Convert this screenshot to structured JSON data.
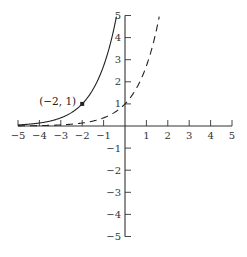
{
  "chart_data": {
    "type": "line",
    "title": "",
    "xlabel": "",
    "ylabel": "",
    "xlim": [
      -5,
      5
    ],
    "ylim": [
      -5,
      5
    ],
    "grid": false,
    "legend": null,
    "x_ticks": [
      -5,
      -4,
      -3,
      -2,
      -1,
      1,
      2,
      3,
      4,
      5
    ],
    "x_tick_labels": [
      "−5",
      "−4",
      "−3",
      "−2",
      "−1",
      "1",
      "2",
      "3",
      "4",
      "5"
    ],
    "y_ticks": [
      5,
      4,
      3,
      2,
      1,
      -1,
      -2,
      -3,
      -4,
      -5
    ],
    "y_tick_labels": [
      "5",
      "4",
      "3",
      "2",
      "1",
      "−1",
      "−2",
      "−3",
      "−4",
      "−5"
    ],
    "series": [
      {
        "name": "solid curve (shifted exponential)",
        "style": "solid",
        "function": "y = e^(x+2)",
        "x": [
          -5,
          -4,
          -3,
          -2,
          -1.5,
          -1,
          -0.5,
          -0.39
        ],
        "values": [
          0.05,
          0.14,
          0.37,
          1.0,
          1.65,
          2.72,
          4.48,
          5.0
        ]
      },
      {
        "name": "dashed curve (exponential)",
        "style": "dashed",
        "function": "y = e^x",
        "x": [
          -5,
          -4,
          -3,
          -2,
          -1,
          0,
          0.5,
          1,
          1.5,
          1.61
        ],
        "values": [
          0.007,
          0.02,
          0.05,
          0.14,
          0.37,
          1.0,
          1.65,
          2.72,
          4.48,
          5.0
        ]
      }
    ],
    "annotations": [
      {
        "text": "(−2, 1)",
        "x": -2,
        "y": 1,
        "marker": "filled-square"
      }
    ]
  },
  "colors": {
    "axis": "#333333",
    "curve": "#222222",
    "background": "#ffffff"
  }
}
